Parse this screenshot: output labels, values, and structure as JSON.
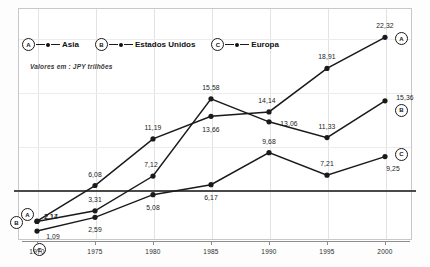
{
  "chart_data": {
    "type": "line",
    "title": "",
    "subtitle": "Valores em : JPY trilhões",
    "xlabel": "",
    "ylabel": "",
    "categories": [
      "1970",
      "1975",
      "1980",
      "1985",
      "1990",
      "1995",
      "2000"
    ],
    "grid": true,
    "legend_position": "top-left",
    "series": [
      {
        "name": "Asia",
        "badge": "A",
        "values": [
          2.17,
          6.08,
          11.19,
          13.66,
          14.14,
          18.91,
          22.32
        ],
        "labels": [
          "2,17",
          "6,08",
          "11,19",
          "13,66",
          "14,14",
          "18,91",
          "22,32"
        ]
      },
      {
        "name": "Estados Unidos",
        "badge": "B",
        "values": [
          2.14,
          3.31,
          7.12,
          15.58,
          13.06,
          11.33,
          15.36
        ],
        "labels": [
          "2,14",
          "3,31",
          "7,12",
          "15,58",
          "13,06",
          "11,33",
          "15,36"
        ]
      },
      {
        "name": "Europa",
        "badge": "C",
        "values": [
          1.09,
          2.59,
          5.08,
          6.17,
          9.68,
          7.21,
          9.25
        ],
        "labels": [
          "1,09",
          "2,59",
          "5,08",
          "6,17",
          "9,68",
          "7,21",
          "9,25"
        ]
      }
    ],
    "ylim": [
      0,
      24
    ],
    "colors": {
      "line": "#1a1a1a",
      "grid": "#e3e3e3",
      "rule": "#4a4a46",
      "axis": "#8d8d8d",
      "background": "#ffffff"
    }
  },
  "legend": {
    "items": [
      {
        "badge": "A",
        "label": "Asia"
      },
      {
        "badge": "B",
        "label": "Estados Unidos"
      },
      {
        "badge": "C",
        "label": "Europa"
      }
    ]
  },
  "axis": {
    "ticks": [
      "1970",
      "1975",
      "1980",
      "1985",
      "1990",
      "1995",
      "2000"
    ]
  },
  "end_badges": [
    {
      "badge": "A"
    },
    {
      "badge": "B"
    },
    {
      "badge": "C"
    }
  ],
  "start_badges": [
    {
      "badge": "A"
    },
    {
      "badge": "B"
    },
    {
      "badge": "C"
    }
  ]
}
